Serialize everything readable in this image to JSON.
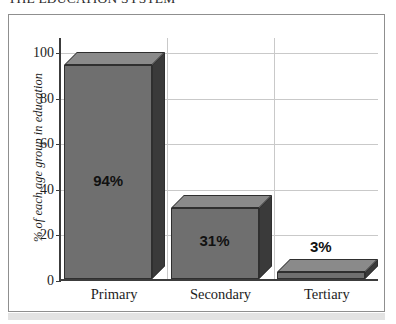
{
  "chart_data": {
    "type": "bar",
    "title": "THE EDUCATION SYSTEM",
    "xlabel": "",
    "ylabel": "% of each age group in education",
    "categories": [
      "Primary",
      "Secondary",
      "Tertiary"
    ],
    "values": [
      94,
      31,
      3
    ],
    "data_labels": [
      "94%",
      "31%",
      "3%"
    ],
    "ylim": [
      0,
      100
    ],
    "yticks": [
      0,
      20,
      40,
      60,
      80,
      100
    ],
    "ytick_labels": [
      "0",
      "20",
      "40",
      "60",
      "80",
      "100"
    ],
    "grid": "horizontal",
    "legend": "none",
    "style": "3d-bar",
    "colors": {
      "bar_front": "#6f6f6f",
      "bar_top": "#8a8a8a",
      "bar_side": "#3a3a3a",
      "bar_edge": "#2f2f2f",
      "axis": "#3c3c3c",
      "gridline": "#c9c9c9",
      "frame": "#8f8f8f",
      "text": "#1d1d1d",
      "background": "#ffffff"
    }
  }
}
